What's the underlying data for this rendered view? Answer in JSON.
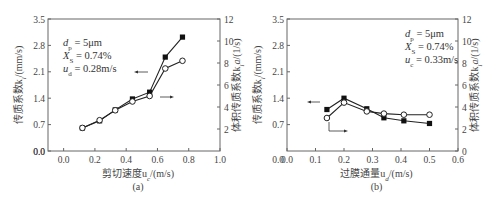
{
  "chart_data": [
    {
      "panel_label": "(a)",
      "type": "line",
      "xlabel": "剪切速度u_c/(m/s)",
      "ylabel_left": "传质系数k_l/(mm/s)",
      "ylabel_right": "体积传质系数k_l a/(1/s)",
      "xlim": [
        -0.1,
        1.0
      ],
      "xticks": [
        "0.0",
        "0.2",
        "0.4",
        "0.6",
        "0.8",
        "1.0"
      ],
      "ylim_left": [
        0.0,
        3.5
      ],
      "yticks_left": [
        "0.0",
        "0.7",
        "1.4",
        "2.1",
        "2.8",
        "3.5"
      ],
      "ylim_right": [
        0,
        12
      ],
      "yticks_right": [
        "2",
        "4",
        "6",
        "8",
        "10",
        "12"
      ],
      "annotations": [
        "d_p = 5μm",
        "X_S = 0.74%",
        "u_d = 0.28m/s"
      ],
      "series": [
        {
          "name": "k_l (filled squares, left axis)",
          "x": [
            0.12,
            0.23,
            0.33,
            0.44,
            0.55,
            0.65,
            0.76
          ],
          "values": [
            0.61,
            0.8,
            1.09,
            1.38,
            1.56,
            2.49,
            3.02
          ]
        },
        {
          "name": "k_l a (open circles, right axis)",
          "x": [
            0.12,
            0.23,
            0.33,
            0.44,
            0.55,
            0.65,
            0.76
          ],
          "values": [
            2.1,
            2.8,
            3.7,
            4.5,
            5.0,
            7.5,
            8.2
          ]
        }
      ]
    },
    {
      "panel_label": "(b)",
      "type": "line",
      "xlabel": "过膜通量u_d/(m/s)",
      "ylabel_left": "传质系数k_l/(mm/s)",
      "ylabel_right": "体积传质系数k_l a/(1/s)",
      "xlim": [
        0.0,
        0.6
      ],
      "xticks": [
        "0.0",
        "0.1",
        "0.2",
        "0.3",
        "0.4",
        "0.5",
        "0.6"
      ],
      "ylim_left": [
        0.0,
        3.5
      ],
      "yticks_left": [
        "0.7",
        "1.4",
        "2.1",
        "2.8",
        "3.5"
      ],
      "ylim_right": [
        0,
        12
      ],
      "yticks_right": [
        "0",
        "2",
        "4",
        "6",
        "8",
        "10",
        "12"
      ],
      "annotations": [
        "d_p = 5μm",
        "X_S = 0.74%",
        "u_c = 0.33m/s"
      ],
      "series": [
        {
          "name": "k_l (filled squares, left axis)",
          "x": [
            0.14,
            0.2,
            0.28,
            0.34,
            0.41,
            0.5
          ],
          "values": [
            1.1,
            1.4,
            1.12,
            0.88,
            0.8,
            0.73
          ]
        },
        {
          "name": "k_l a (open circles, right axis)",
          "x": [
            0.14,
            0.2,
            0.28,
            0.34,
            0.41,
            0.5
          ],
          "values": [
            3.0,
            4.4,
            3.6,
            3.4,
            3.3,
            3.3
          ]
        }
      ]
    }
  ],
  "text": {
    "a_label": "(a)",
    "b_label": "(b)",
    "a_xlabel": "剪切速度u",
    "a_xlabel_sub": "c",
    "a_xlabel_unit": "/(m/s)",
    "b_xlabel": "过膜通量u",
    "b_xlabel_sub": "d",
    "b_xlabel_unit": "/(m/s)",
    "ylabel_left": "传质系数k",
    "ylabel_left_sub": "l",
    "ylabel_left_unit": "/(mm/s)",
    "ylabel_right": "体积传质系数k",
    "ylabel_right_sub": "l",
    "ylabel_right_a": "a",
    "ylabel_right_unit": "/(1/s)",
    "a_ann1_var": "d",
    "a_ann1_sub": "p",
    "a_ann1_val": " = 5μm",
    "a_ann2_var": "X",
    "a_ann2_sub": "S",
    "a_ann2_val": " = 0.74%",
    "a_ann3_var": "u",
    "a_ann3_sub": "d",
    "a_ann3_val": " = 0.28m/s",
    "b_ann1_var": "d",
    "b_ann1_sub": "p",
    "b_ann1_val": " = 5μm",
    "b_ann2_var": "X",
    "b_ann2_sub": "S",
    "b_ann2_val": " = 0.74%",
    "b_ann3_var": "u",
    "b_ann3_sub": "c",
    "b_ann3_val": " = 0.33m/s"
  }
}
